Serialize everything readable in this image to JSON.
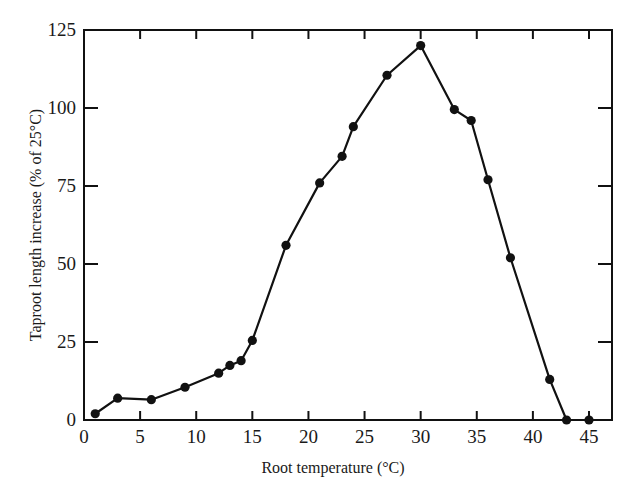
{
  "chart_data": {
    "type": "line",
    "title": "",
    "xlabel": "Root temperature (°C)",
    "ylabel": "Taproot length increase (% of 25°C)",
    "xlim": [
      0,
      47
    ],
    "ylim": [
      0,
      125
    ],
    "x_ticks": [
      0,
      5,
      10,
      15,
      20,
      25,
      30,
      35,
      40,
      45
    ],
    "y_ticks": [
      0,
      25,
      50,
      75,
      100,
      125
    ],
    "grid": false,
    "legend": null,
    "markers": "filled-circle",
    "series": [
      {
        "name": "Taproot length increase",
        "x": [
          1,
          3,
          6,
          9,
          12,
          13,
          14,
          15,
          18,
          21,
          23,
          24,
          27,
          30,
          33,
          34.5,
          36,
          38,
          41.5,
          43,
          45
        ],
        "y": [
          2,
          7,
          6.5,
          10.5,
          15,
          17.5,
          19,
          25.5,
          56,
          76,
          84.5,
          94,
          110.5,
          120,
          99.5,
          96,
          77,
          52,
          13,
          0,
          0
        ]
      }
    ],
    "color": "#111111"
  }
}
